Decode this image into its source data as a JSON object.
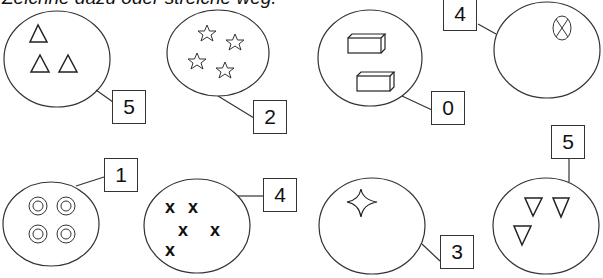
{
  "header": {
    "instruction": "Zeichne dazu oder streiche weg."
  },
  "groups": [
    {
      "id": "triangles",
      "symbol": "triangle-up",
      "count": 3,
      "target": "5"
    },
    {
      "id": "stars",
      "symbol": "star",
      "count": 4,
      "target": "2"
    },
    {
      "id": "blocks",
      "symbol": "cuboid",
      "count": 2,
      "target": "0"
    },
    {
      "id": "crossed-circle",
      "symbol": "crossed-circle",
      "count": 1,
      "target": "4"
    },
    {
      "id": "rings",
      "symbol": "double-circle",
      "count": 4,
      "target": "1"
    },
    {
      "id": "x-marks",
      "symbol": "x-mark",
      "count": 5,
      "target": "4"
    },
    {
      "id": "sparkle",
      "symbol": "four-point-star",
      "count": 1,
      "target": "3"
    },
    {
      "id": "down-triangles",
      "symbol": "triangle-down",
      "count": 3,
      "target": "5"
    }
  ]
}
